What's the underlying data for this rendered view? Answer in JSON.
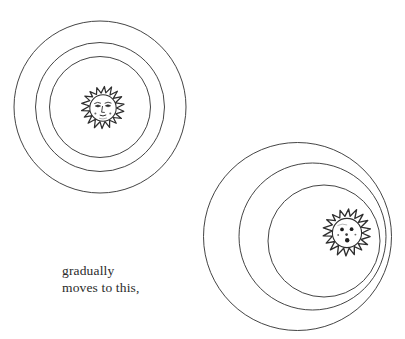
{
  "page": {
    "background_color": "#ffffff",
    "ink_color": "#3a3a3a",
    "width": 405,
    "height": 339
  },
  "caption": {
    "line1": "gradually",
    "line2": "moves to this,",
    "color": "#2b2b2b",
    "x": 62,
    "y": 263
  },
  "figures": [
    {
      "name": "concentric-sun-figure",
      "label": "left figure: concentric rings with centered sun",
      "rings": [
        {
          "name": "outer-ring",
          "cx": 100,
          "cy": 107,
          "r": 86
        },
        {
          "name": "middle-ring",
          "cx": 100,
          "cy": 107,
          "r": 64.5
        },
        {
          "name": "inner-ring",
          "cx": 100,
          "cy": 107,
          "r": 50.5
        }
      ],
      "sun": {
        "name": "sun-face-left",
        "cx": 103,
        "cy": 108,
        "face_r": 13.5,
        "ray_r": 21.5,
        "ray_count": 17,
        "face_style": "oval eyes with brows, long nose, small mouth, cheek dots"
      }
    },
    {
      "name": "eccentric-sun-figure",
      "label": "right figure: offset rings with sun pushed to the right edge",
      "rings": [
        {
          "name": "outer-ring",
          "cx": 297.5,
          "cy": 236.5,
          "r": 94
        },
        {
          "name": "middle-ring",
          "cx": 312.5,
          "cy": 236.5,
          "r": 73.5
        },
        {
          "name": "inner-ring",
          "cx": 324,
          "cy": 241,
          "r": 56
        }
      ],
      "sun": {
        "name": "sun-face-right",
        "cx": 347,
        "cy": 233,
        "face_r": 15,
        "ray_r": 24,
        "ray_count": 18,
        "face_style": "two round dot eyes, round nose, small dot mouth"
      }
    }
  ]
}
